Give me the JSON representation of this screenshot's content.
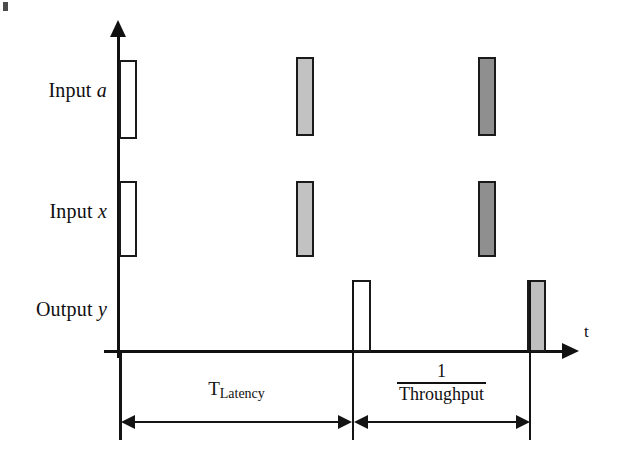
{
  "figure": {
    "type": "timing-diagram",
    "background": "#ffffff",
    "stroke_color": "#111111",
    "width": 624,
    "height": 469
  },
  "axes": {
    "vertical_label": "",
    "time_axis_label": "t",
    "origin": {
      "x": 119,
      "y": 352
    }
  },
  "rows": [
    {
      "id": "input-a",
      "label_prefix": "Input",
      "label_var": "a",
      "label_full": "Input a",
      "y_top": 60,
      "y_bottom": 138
    },
    {
      "id": "input-x",
      "label_prefix": "Input",
      "label_var": "x",
      "label_full": "Input x",
      "y_top": 181,
      "y_bottom": 256
    },
    {
      "id": "output-y",
      "label_prefix": "Output",
      "label_var": "y",
      "label_full": "Output y",
      "y_top": 280,
      "y_bottom": 352
    }
  ],
  "colors": {
    "stroke": "#1a1a1a",
    "fill_empty": "#ffffff",
    "fill_light_gray": "#c2c2c2",
    "fill_dark_gray": "#8f8f8f",
    "fill_output_gray": "#bfbfbf"
  },
  "pulses": [
    {
      "id": "input-a-pulse-1",
      "row": "input-a",
      "x": 119,
      "width": 18,
      "y": 60,
      "height": 79,
      "fill": "#ffffff",
      "shade": "empty"
    },
    {
      "id": "input-a-pulse-2",
      "row": "input-a",
      "x": 296,
      "width": 18,
      "y": 57,
      "height": 79,
      "fill": "#c2c2c2",
      "shade": "light-gray"
    },
    {
      "id": "input-a-pulse-3",
      "row": "input-a",
      "x": 478,
      "width": 18,
      "y": 57,
      "height": 79,
      "fill": "#8f8f8f",
      "shade": "dark-gray"
    },
    {
      "id": "input-x-pulse-1",
      "row": "input-x",
      "x": 119,
      "width": 18,
      "y": 181,
      "height": 76,
      "fill": "#ffffff",
      "shade": "empty"
    },
    {
      "id": "input-x-pulse-2",
      "row": "input-x",
      "x": 296,
      "width": 18,
      "y": 181,
      "height": 76,
      "fill": "#c2c2c2",
      "shade": "light-gray"
    },
    {
      "id": "input-x-pulse-3",
      "row": "input-x",
      "x": 478,
      "width": 18,
      "y": 181,
      "height": 76,
      "fill": "#8f8f8f",
      "shade": "dark-gray"
    },
    {
      "id": "output-y-pulse-1",
      "row": "output-y",
      "x": 352,
      "width": 19,
      "y": 280,
      "height": 73,
      "fill": "#ffffff",
      "shade": "empty"
    },
    {
      "id": "output-y-pulse-2",
      "row": "output-y",
      "x": 527,
      "width": 19,
      "y": 280,
      "height": 73,
      "fill": "#bfbfbf",
      "shade": "light-gray"
    }
  ],
  "markers": [
    {
      "id": "marker-origin",
      "x": 120
    },
    {
      "id": "marker-first-output",
      "x": 353
    },
    {
      "id": "marker-second-output",
      "x": 530
    }
  ],
  "dimensions": [
    {
      "id": "latency",
      "caption_main": "T",
      "caption_sub": "Latency",
      "caption_type": "subscript",
      "from_x": 120,
      "to_x": 353,
      "y": 422
    },
    {
      "id": "throughput",
      "caption_numerator": "1",
      "caption_denominator": "Throughput",
      "caption_type": "fraction",
      "from_x": 353,
      "to_x": 530,
      "y": 422
    }
  ]
}
